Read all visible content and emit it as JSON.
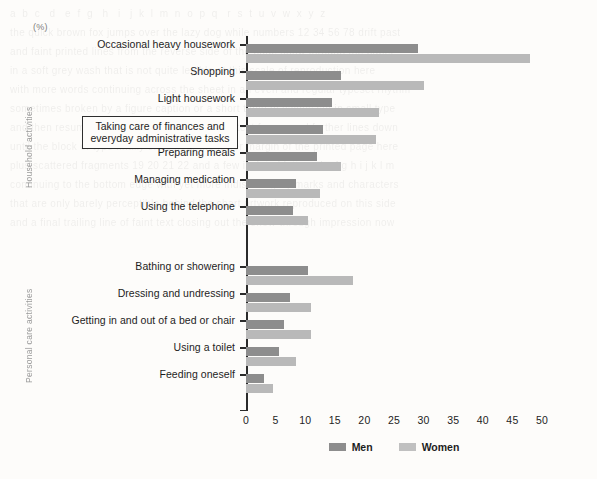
{
  "unit_label": "(%)",
  "groups": [
    {
      "id": "household",
      "label": "Household activities"
    },
    {
      "id": "personal",
      "label": "Personal care activities"
    }
  ],
  "xaxis": {
    "ticks": [
      "0",
      "5",
      "10",
      "15",
      "20",
      "25",
      "30",
      "35",
      "40",
      "45",
      "50"
    ],
    "min": 0,
    "max": 50
  },
  "legend": [
    {
      "key": "men",
      "label": "Men",
      "color": "#8d8d8d"
    },
    {
      "key": "women",
      "label": "Women",
      "color": "#c0c0c0"
    }
  ],
  "ghost_text": "a  b  c   d   e  f  g   h   i   j  k  l  m  n  o  p  q   r  s  t  u  v  w  x  y  z\nthe quick brown fox jumps over the lazy dog while numbers 12 34 56 78 drift past\nand faint printed lines from the reverse side of the page show through the paper\nin a soft grey wash that is not quite legible at this scale of reproduction here\nwith more words continuing across the sheet in an even and regular typeset rhythm\nsometimes broken by a figure caption or a short table of values set in small type\nand then resuming again with ordinary running text for several further lines down\nuntil the block of type finally ends near the lower margin of the printed page here\nplus scattered fragments 19 20 21 22 and a few isolated letters d e f g h i j k l m\ncontinuing to the bottom edge with yet more indistinct grey marks and characters\nthat are only barely perceptible behind the chart artwork reproduced on this side\nand a final trailing line of faint text closing out the show-through impression now",
  "chart_data": {
    "type": "bar",
    "orientation": "horizontal",
    "title": "",
    "xlabel": "(%)",
    "ylabel": "",
    "xlim": [
      0,
      50
    ],
    "grid": false,
    "legend_position": "bottom-center",
    "categories": [
      "Occasional heavy housework",
      "Shopping",
      "Light housework",
      "Taking care of finances and everyday administrative tasks",
      "Preparing meals",
      "Managing medication",
      "Using the telephone",
      "Bathing or showering",
      "Dressing and undressing",
      "Getting in and out of a bed or chair",
      "Using a toilet",
      "Feeding oneself"
    ],
    "series": [
      {
        "name": "Men",
        "values": [
          29,
          16,
          14.5,
          13,
          12,
          8.5,
          8,
          10.5,
          7.5,
          6.5,
          5.5,
          3
        ]
      },
      {
        "name": "Women",
        "values": [
          48,
          30,
          22.5,
          22,
          16,
          12.5,
          10.5,
          18,
          11,
          11,
          8.5,
          4.5
        ]
      }
    ]
  },
  "rows": [
    {
      "name": "Occasional heavy housework",
      "group": "household",
      "boxed": false,
      "men": 29,
      "women": 48
    },
    {
      "name": "Shopping",
      "group": "household",
      "boxed": false,
      "men": 16,
      "women": 30
    },
    {
      "name": "Light housework",
      "group": "household",
      "boxed": false,
      "men": 14.5,
      "women": 22.5
    },
    {
      "name": "Taking care of finances and everyday administrative tasks",
      "group": "household",
      "boxed": true,
      "men": 13,
      "women": 22
    },
    {
      "name": "Preparing meals",
      "group": "household",
      "boxed": false,
      "men": 12,
      "women": 16
    },
    {
      "name": "Managing medication",
      "group": "household",
      "boxed": false,
      "men": 8.5,
      "women": 12.5
    },
    {
      "name": "Using the telephone",
      "group": "household",
      "boxed": false,
      "men": 8,
      "women": 10.5
    },
    {
      "name": "Bathing or showering",
      "group": "personal",
      "boxed": false,
      "men": 10.5,
      "women": 18
    },
    {
      "name": "Dressing and undressing",
      "group": "personal",
      "boxed": false,
      "men": 7.5,
      "women": 11
    },
    {
      "name": "Getting in and out of a bed or chair",
      "group": "personal",
      "boxed": false,
      "men": 6.5,
      "women": 11
    },
    {
      "name": "Using a toilet",
      "group": "personal",
      "boxed": false,
      "men": 5.5,
      "women": 8.5
    },
    {
      "name": "Feeding oneself",
      "group": "personal",
      "boxed": false,
      "men": 3,
      "women": 4.5
    }
  ]
}
